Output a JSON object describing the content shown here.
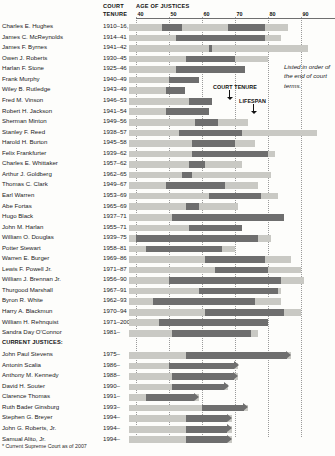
{
  "header": {
    "court_tenure_line1": "COURT",
    "court_tenure_line2": "TENURE",
    "age_axis_title": "AGE OF JUSTICES"
  },
  "note": "Listed in order of the end of court terms.",
  "legend": {
    "court_tenure_label": "COURT TENURE",
    "lifespan_label": "LIFESPAN"
  },
  "section_heading": "CURRENT JUSTICES:",
  "footnote": "* Current Supreme Court as of 2007",
  "colors": {
    "lifespan_bar": "#c9c9c4",
    "tenure_bar": "#6e6e6e",
    "gridline": "#9a9a9a",
    "text": "#1b1b1b",
    "background": "#fdfdfb"
  },
  "chart_data": {
    "type": "bar",
    "title": "AGE OF JUSTICES",
    "subtitle": "Listed in order of the end of court terms.",
    "xlabel": "AGE OF JUSTICES",
    "ylabel": "",
    "xlim": [
      38,
      93
    ],
    "ticks": [
      40,
      50,
      60,
      70,
      80,
      90
    ],
    "tick_labels": [
      "40",
      "50",
      "60",
      "70",
      "80",
      "90"
    ],
    "grid": true,
    "legend_position": "inside-upper-right",
    "series": [
      {
        "name": "LIFESPAN",
        "color": "#c9c9c4"
      },
      {
        "name": "COURT TENURE",
        "color": "#6e6e6e"
      }
    ],
    "columns": [
      "Justice",
      "Court Tenure",
      "Lifespan age range",
      "Tenure age range"
    ],
    "rows": [
      {
        "name": "Charles E. Hughes",
        "tenure": "1910–16, 1930–41",
        "life_start": 38,
        "life_end": 86,
        "tenure_segments": [
          [
            48,
            54
          ],
          [
            68,
            79
          ]
        ],
        "current": false
      },
      {
        "name": "James C. McReynolds",
        "tenure": "1914–41",
        "life_start": 38,
        "life_end": 84,
        "tenure_segments": [
          [
            52,
            79
          ]
        ],
        "current": false
      },
      {
        "name": "James F. Byrnes",
        "tenure": "1941–42",
        "life_start": 38,
        "life_end": 92,
        "tenure_segments": [
          [
            62,
            63
          ]
        ],
        "current": false
      },
      {
        "name": "Owen J. Roberts",
        "tenure": "1930–45",
        "life_start": 38,
        "life_end": 80,
        "tenure_segments": [
          [
            55,
            70
          ]
        ],
        "current": false
      },
      {
        "name": "Harlan F. Stone",
        "tenure": "1925–46",
        "life_start": 38,
        "life_end": 73,
        "tenure_segments": [
          [
            52,
            73
          ]
        ],
        "current": false
      },
      {
        "name": "Frank Murphy",
        "tenure": "1940–49",
        "life_start": 38,
        "life_end": 59,
        "tenure_segments": [
          [
            50,
            59
          ]
        ],
        "current": false
      },
      {
        "name": "Wiley B. Rutledge",
        "tenure": "1943–49",
        "life_start": 38,
        "life_end": 55,
        "tenure_segments": [
          [
            49,
            55
          ]
        ],
        "current": false
      },
      {
        "name": "Fred M. Vinson",
        "tenure": "1946–53",
        "life_start": 38,
        "life_end": 63,
        "tenure_segments": [
          [
            56,
            63
          ]
        ],
        "current": false
      },
      {
        "name": "Robert H. Jackson",
        "tenure": "1941–54",
        "life_start": 38,
        "life_end": 62,
        "tenure_segments": [
          [
            49,
            62
          ]
        ],
        "current": false
      },
      {
        "name": "Sherman Minton",
        "tenure": "1949–56",
        "life_start": 38,
        "life_end": 74,
        "tenure_segments": [
          [
            58,
            65
          ]
        ],
        "current": false
      },
      {
        "name": "Stanley F. Reed",
        "tenure": "1938–57",
        "life_start": 38,
        "life_end": 95,
        "tenure_segments": [
          [
            53,
            72
          ]
        ],
        "current": false
      },
      {
        "name": "Harold H. Burton",
        "tenure": "1945–58",
        "life_start": 38,
        "life_end": 76,
        "tenure_segments": [
          [
            57,
            70
          ]
        ],
        "current": false
      },
      {
        "name": "Felix Frankfurter",
        "tenure": "1939–62",
        "life_start": 38,
        "life_end": 82,
        "tenure_segments": [
          [
            57,
            80
          ]
        ],
        "current": false
      },
      {
        "name": "Charles E. Whittaker",
        "tenure": "1957–62",
        "life_start": 38,
        "life_end": 72,
        "tenure_segments": [
          [
            56,
            61
          ]
        ],
        "current": false
      },
      {
        "name": "Arthur J. Goldberg",
        "tenure": "1962–65",
        "life_start": 38,
        "life_end": 81,
        "tenure_segments": [
          [
            54,
            57
          ]
        ],
        "current": false
      },
      {
        "name": "Thomas C. Clark",
        "tenure": "1949–67",
        "life_start": 38,
        "life_end": 77,
        "tenure_segments": [
          [
            49,
            67
          ]
        ],
        "current": false
      },
      {
        "name": "Earl Warren",
        "tenure": "1953–69",
        "life_start": 38,
        "life_end": 83,
        "tenure_segments": [
          [
            62,
            78
          ]
        ],
        "current": false
      },
      {
        "name": "Abe Fortas",
        "tenure": "1965–69",
        "life_start": 38,
        "life_end": 71,
        "tenure_segments": [
          [
            55,
            59
          ]
        ],
        "current": false
      },
      {
        "name": "Hugo Black",
        "tenure": "1937–71",
        "life_start": 38,
        "life_end": 85,
        "tenure_segments": [
          [
            51,
            85
          ]
        ],
        "current": false
      },
      {
        "name": "John M. Harlan",
        "tenure": "1955–71",
        "life_start": 38,
        "life_end": 72,
        "tenure_segments": [
          [
            56,
            72
          ]
        ],
        "current": false
      },
      {
        "name": "William O. Douglas",
        "tenure": "1939–75",
        "life_start": 38,
        "life_end": 81,
        "tenure_segments": [
          [
            40,
            77
          ]
        ],
        "current": false
      },
      {
        "name": "Potter Stewart",
        "tenure": "1958–81",
        "life_start": 38,
        "life_end": 70,
        "tenure_segments": [
          [
            43,
            66
          ]
        ],
        "current": false
      },
      {
        "name": "Warren E. Burger",
        "tenure": "1969–86",
        "life_start": 38,
        "life_end": 87,
        "tenure_segments": [
          [
            61,
            79
          ]
        ],
        "current": false
      },
      {
        "name": "Lewis F. Powell Jr.",
        "tenure": "1971–87",
        "life_start": 38,
        "life_end": 90,
        "tenure_segments": [
          [
            64,
            80
          ]
        ],
        "current": false
      },
      {
        "name": "William J. Brennan Jr.",
        "tenure": "1956–90",
        "life_start": 38,
        "life_end": 91,
        "tenure_segments": [
          [
            50,
            84
          ]
        ],
        "current": false
      },
      {
        "name": "Thurgood Marshall",
        "tenure": "1967–91",
        "life_start": 38,
        "life_end": 84,
        "tenure_segments": [
          [
            59,
            83
          ]
        ],
        "current": false
      },
      {
        "name": "Byron R. White",
        "tenure": "1962–93",
        "life_start": 38,
        "life_end": 84,
        "tenure_segments": [
          [
            45,
            76
          ]
        ],
        "current": false
      },
      {
        "name": "Harry A. Blackmun",
        "tenure": "1970–94",
        "life_start": 38,
        "life_end": 90,
        "tenure_segments": [
          [
            61,
            85
          ]
        ],
        "current": false
      },
      {
        "name": "William H. Rehnquist",
        "tenure": "1971–2005",
        "life_start": 38,
        "life_end": 80,
        "tenure_segments": [
          [
            47,
            80
          ]
        ],
        "current": false
      },
      {
        "name": "Sandra Day O'Connor",
        "tenure": "1981–",
        "life_start": 38,
        "life_end": 77,
        "tenure_segments": [
          [
            51,
            75
          ]
        ],
        "current": false
      },
      {
        "name": "John Paul Stevens",
        "tenure": "1975–",
        "life_start": 38,
        "life_end": 87,
        "tenure_segments": [
          [
            55,
            87
          ]
        ],
        "current": true
      },
      {
        "name": "Antonin Scalia",
        "tenure": "1986–",
        "life_start": 38,
        "life_end": 71,
        "tenure_segments": [
          [
            50,
            71
          ]
        ],
        "current": true
      },
      {
        "name": "Anthony M. Kennedy",
        "tenure": "1988–",
        "life_start": 38,
        "life_end": 71,
        "tenure_segments": [
          [
            51,
            71
          ]
        ],
        "current": true
      },
      {
        "name": "David H. Souter",
        "tenure": "1990–",
        "life_start": 38,
        "life_end": 68,
        "tenure_segments": [
          [
            51,
            68
          ]
        ],
        "current": true
      },
      {
        "name": "Clarence Thomas",
        "tenure": "1991–",
        "life_start": 38,
        "life_end": 59,
        "tenure_segments": [
          [
            43,
            59
          ]
        ],
        "current": true
      },
      {
        "name": "Ruth Bader Ginsburg",
        "tenure": "1993–",
        "life_start": 38,
        "life_end": 74,
        "tenure_segments": [
          [
            60,
            74
          ]
        ],
        "current": true
      },
      {
        "name": "Stephen G. Breyer",
        "tenure": "1994–",
        "life_start": 38,
        "life_end": 69,
        "tenure_segments": [
          [
            55,
            69
          ]
        ],
        "current": true
      },
      {
        "name": "John G. Roberts, Jr.",
        "tenure": "1994–",
        "life_start": 38,
        "life_end": 69,
        "tenure_segments": [
          [
            55,
            69
          ]
        ],
        "current": true
      },
      {
        "name": "Samual Alito, Jr.",
        "tenure": "1994–",
        "life_start": 38,
        "life_end": 69,
        "tenure_segments": [
          [
            55,
            69
          ]
        ],
        "current": true
      }
    ]
  }
}
